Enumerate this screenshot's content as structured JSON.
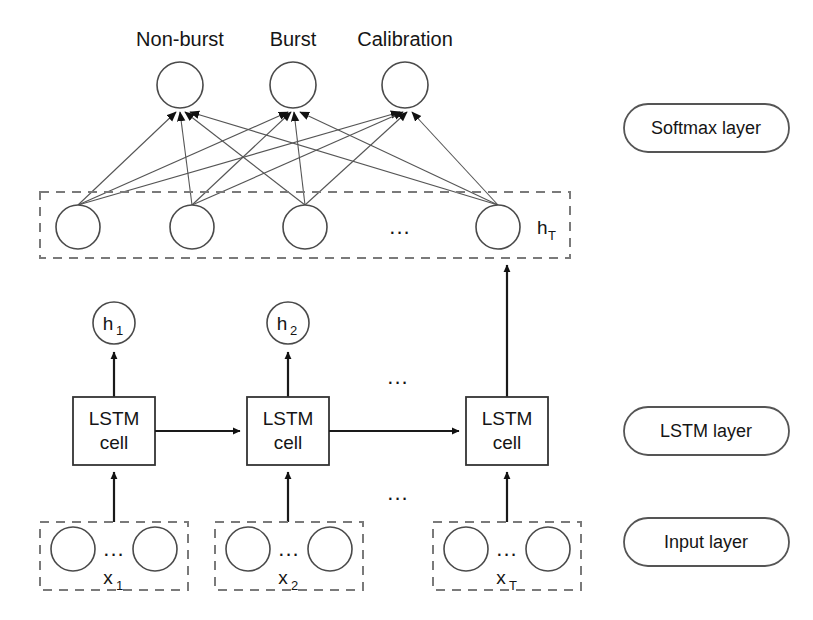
{
  "figure": {
    "background_color": "#ffffff",
    "line_color": "#555555",
    "dashed_box_color": "#7a7a7a",
    "text_color": "#151515"
  },
  "output_layer": {
    "name": "softmax-output-nodes",
    "labels": [
      "Non-burst",
      "Burst",
      "Calibration"
    ],
    "node_count": 3,
    "nodes": [
      {
        "label": "Non-burst",
        "cx": 180,
        "cy": 85,
        "r": 23
      },
      {
        "label": "Burst",
        "cx": 293,
        "cy": 85,
        "r": 23
      },
      {
        "label": "Calibration",
        "cx": 405,
        "cy": 85,
        "r": 23
      }
    ]
  },
  "hidden_layer": {
    "name": "hidden-state-layer",
    "box": {
      "x": 40,
      "y": 192,
      "width": 530,
      "height": 66
    },
    "state_label": "h",
    "state_subscript": "T",
    "ellipsis": "...",
    "ellipsis_x": 400,
    "nodes": [
      {
        "cx": 78,
        "cy": 227,
        "r": 22
      },
      {
        "cx": 192,
        "cy": 227,
        "r": 22
      },
      {
        "cx": 305,
        "cy": 227,
        "r": 22
      },
      {
        "cx": 498,
        "cy": 227,
        "r": 22
      }
    ]
  },
  "hidden_outputs": {
    "name": "per-step-hidden-outputs",
    "items": [
      {
        "label": "h",
        "subscript": "1",
        "cx": 114,
        "cy": 323,
        "r": 21
      },
      {
        "label": "h",
        "subscript": "2",
        "cx": 288,
        "cy": 323,
        "r": 21
      }
    ],
    "ellipsis": "..."
  },
  "lstm_layer": {
    "name": "lstm-cell-row",
    "cell_line1": "LSTM",
    "cell_line2": "cell",
    "ellipsis_above": "...",
    "ellipsis_below": "...",
    "cells": [
      {
        "x": 73,
        "y": 397,
        "width": 82,
        "height": 68
      },
      {
        "x": 247,
        "y": 397,
        "width": 82,
        "height": 68
      },
      {
        "x": 466,
        "y": 397,
        "width": 82,
        "height": 68
      }
    ]
  },
  "input_layer": {
    "name": "input-feature-groups",
    "ellipsis": "...",
    "groups": [
      {
        "label": "x",
        "subscript": "1",
        "box": {
          "x": 40,
          "y": 522,
          "width": 148,
          "height": 68
        },
        "nodes": [
          {
            "cx": 73,
            "cy": 549,
            "r": 22
          },
          {
            "cx": 155,
            "cy": 549,
            "r": 22
          }
        ]
      },
      {
        "label": "x",
        "subscript": "2",
        "box": {
          "x": 215,
          "y": 522,
          "width": 148,
          "height": 68
        },
        "nodes": [
          {
            "cx": 248,
            "cy": 549,
            "r": 22
          },
          {
            "cx": 330,
            "cy": 549,
            "r": 22
          }
        ]
      },
      {
        "label": "x",
        "subscript": "T",
        "box": {
          "x": 433,
          "y": 522,
          "width": 148,
          "height": 68
        },
        "nodes": [
          {
            "cx": 466,
            "cy": 549,
            "r": 22
          },
          {
            "cx": 548,
            "cy": 549,
            "r": 22
          }
        ]
      }
    ]
  },
  "legend": {
    "name": "layer-legend",
    "items": [
      {
        "label": "Softmax layer",
        "x": 624,
        "y": 104,
        "width": 165,
        "height": 48
      },
      {
        "label": "LSTM layer",
        "x": 624,
        "y": 407,
        "width": 165,
        "height": 48
      },
      {
        "label": "Input layer",
        "x": 624,
        "y": 518,
        "width": 165,
        "height": 48
      }
    ]
  }
}
